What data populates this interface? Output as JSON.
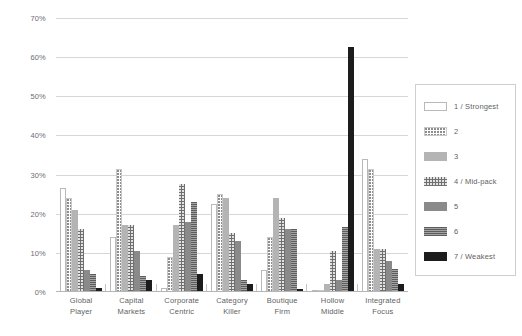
{
  "chart_data": {
    "type": "bar",
    "title": "",
    "xlabel": "",
    "ylabel": "",
    "ylim": [
      0,
      70
    ],
    "grid": true,
    "legend_position": "right",
    "y_ticks": [
      "0%",
      "10%",
      "20%",
      "30%",
      "40%",
      "50%",
      "60%",
      "70%"
    ],
    "y_tick_values": [
      0,
      10,
      20,
      30,
      40,
      50,
      60,
      70
    ],
    "categories": [
      "Global\nPlayer",
      "Capital\nMarkets",
      "Corporate\nCentric",
      "Category\nKiller",
      "Boutique\nFirm",
      "Hollow\nMiddle",
      "Integrated\nFocus"
    ],
    "category_lines": [
      [
        "Global",
        "Player"
      ],
      [
        "Capital",
        "Markets"
      ],
      [
        "Corporate",
        "Centric"
      ],
      [
        "Category",
        "Killer"
      ],
      [
        "Boutique",
        "Firm"
      ],
      [
        "Hollow",
        "Middle"
      ],
      [
        "Integrated",
        "Focus"
      ]
    ],
    "series": [
      {
        "name": "1 / Strongest",
        "style": "s1",
        "values": [
          26.5,
          14.0,
          1.0,
          22.5,
          5.5,
          0.5,
          34.0
        ]
      },
      {
        "name": "2",
        "style": "s2",
        "values": [
          24.0,
          31.5,
          9.0,
          25.0,
          14.0,
          0.5,
          31.5
        ]
      },
      {
        "name": "3",
        "style": "s3",
        "values": [
          21.0,
          17.0,
          17.0,
          24.0,
          24.0,
          2.0,
          11.0
        ]
      },
      {
        "name": "4 / Mid-pack",
        "style": "s4",
        "values": [
          16.0,
          17.0,
          27.5,
          15.0,
          19.0,
          10.5,
          11.0
        ]
      },
      {
        "name": "5",
        "style": "s5",
        "values": [
          5.5,
          10.5,
          18.0,
          13.0,
          16.0,
          3.0,
          8.0
        ]
      },
      {
        "name": "6",
        "style": "s6",
        "values": [
          4.5,
          4.0,
          23.0,
          3.0,
          16.0,
          16.5,
          6.0
        ]
      },
      {
        "name": "7 / Weakest",
        "style": "s7",
        "values": [
          1.0,
          3.0,
          4.5,
          2.0,
          0.8,
          62.7,
          2.0
        ]
      }
    ]
  },
  "legend": {
    "items": [
      {
        "label": "1 / Strongest",
        "style": "s1"
      },
      {
        "label": "2",
        "style": "s2"
      },
      {
        "label": "3",
        "style": "s3"
      },
      {
        "label": "4 / Mid-pack",
        "style": "s4"
      },
      {
        "label": "5",
        "style": "s5"
      },
      {
        "label": "6",
        "style": "s6"
      },
      {
        "label": "7 / Weakest",
        "style": "s7"
      }
    ]
  }
}
